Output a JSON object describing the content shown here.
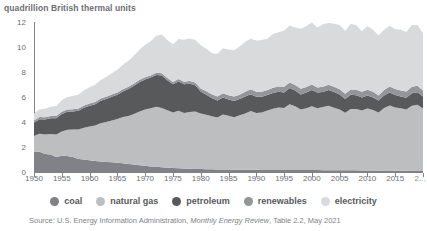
{
  "axis_title": "quadrillion British thermal units",
  "legend": {
    "items": [
      {
        "label": "coal",
        "color": "#808285"
      },
      {
        "label": "natural gas",
        "color": "#bcbec0"
      },
      {
        "label": "petroleum",
        "color": "#58595b"
      },
      {
        "label": "renewables",
        "color": "#939598"
      },
      {
        "label": "electricity",
        "color": "#d9dadb"
      }
    ]
  },
  "source": {
    "prefix": "Source: U.S. Energy Information Administration, ",
    "italic": "Monthly Energy Review",
    "suffix": ", Table 2.2, May 2021"
  },
  "chart_data": {
    "type": "area",
    "title": "",
    "subtitle": "",
    "xlabel": "",
    "ylabel": "quadrillion British thermal units",
    "xlim": [
      1950,
      2020
    ],
    "ylim": [
      0,
      12
    ],
    "yticks": [
      0,
      2,
      4,
      6,
      8,
      10,
      12
    ],
    "xticks": [
      1950,
      1955,
      1960,
      1965,
      1970,
      1975,
      1980,
      1985,
      1990,
      1995,
      2000,
      2005,
      2010,
      2015,
      2020
    ],
    "xtick_labels": [
      "1950",
      "1955",
      "1960",
      "1965",
      "1970",
      "1975",
      "1980",
      "1985",
      "1990",
      "1995",
      "2000",
      "2005",
      "2010",
      "2015",
      "2..."
    ],
    "grid": false,
    "stacked": true,
    "legend_position": "bottom",
    "annotations": [],
    "x": [
      1950,
      1951,
      1952,
      1953,
      1954,
      1955,
      1956,
      1957,
      1958,
      1959,
      1960,
      1961,
      1962,
      1963,
      1964,
      1965,
      1966,
      1967,
      1968,
      1969,
      1970,
      1971,
      1972,
      1973,
      1974,
      1975,
      1976,
      1977,
      1978,
      1979,
      1980,
      1981,
      1982,
      1983,
      1984,
      1985,
      1986,
      1987,
      1988,
      1989,
      1990,
      1991,
      1992,
      1993,
      1994,
      1995,
      1996,
      1997,
      1998,
      1999,
      2000,
      2001,
      2002,
      2003,
      2004,
      2005,
      2006,
      2007,
      2008,
      2009,
      2010,
      2011,
      2012,
      2013,
      2014,
      2015,
      2016,
      2017,
      2018,
      2019,
      2020
    ],
    "series": [
      {
        "name": "coal",
        "color": "#808285",
        "values": [
          1.6,
          1.62,
          1.45,
          1.4,
          1.2,
          1.3,
          1.28,
          1.2,
          1.05,
          1.0,
          0.95,
          0.88,
          0.85,
          0.8,
          0.78,
          0.74,
          0.7,
          0.64,
          0.6,
          0.55,
          0.5,
          0.45,
          0.42,
          0.38,
          0.34,
          0.32,
          0.3,
          0.28,
          0.26,
          0.25,
          0.24,
          0.23,
          0.22,
          0.21,
          0.21,
          0.2,
          0.19,
          0.19,
          0.19,
          0.18,
          0.18,
          0.17,
          0.17,
          0.17,
          0.17,
          0.17,
          0.17,
          0.17,
          0.16,
          0.16,
          0.16,
          0.16,
          0.15,
          0.15,
          0.15,
          0.15,
          0.14,
          0.14,
          0.14,
          0.12,
          0.13,
          0.12,
          0.11,
          0.12,
          0.12,
          0.11,
          0.1,
          0.1,
          0.1,
          0.09,
          0.08
        ]
      },
      {
        "name": "natural gas",
        "color": "#bcbec0",
        "values": [
          1.3,
          1.45,
          1.55,
          1.65,
          1.8,
          1.95,
          2.1,
          2.2,
          2.35,
          2.55,
          2.7,
          2.85,
          3.05,
          3.2,
          3.35,
          3.5,
          3.7,
          3.85,
          4.05,
          4.3,
          4.5,
          4.65,
          4.8,
          4.75,
          4.6,
          4.45,
          4.6,
          4.45,
          4.55,
          4.6,
          4.45,
          4.35,
          4.25,
          4.15,
          4.4,
          4.3,
          4.2,
          4.35,
          4.5,
          4.7,
          4.55,
          4.6,
          4.75,
          4.9,
          5.0,
          4.95,
          5.25,
          5.1,
          4.85,
          4.95,
          5.1,
          4.95,
          5.05,
          5.15,
          5.0,
          4.85,
          4.6,
          4.9,
          4.9,
          4.8,
          4.95,
          4.85,
          4.65,
          5.0,
          5.2,
          5.05,
          5.0,
          4.9,
          5.2,
          5.3,
          5.0
        ]
      },
      {
        "name": "petroleum",
        "color": "#58595b",
        "values": [
          1.05,
          1.15,
          1.2,
          1.25,
          1.3,
          1.4,
          1.45,
          1.45,
          1.5,
          1.6,
          1.65,
          1.7,
          1.8,
          1.85,
          1.9,
          1.95,
          2.05,
          2.15,
          2.25,
          2.35,
          2.4,
          2.45,
          2.55,
          2.6,
          2.4,
          2.25,
          2.35,
          2.3,
          2.25,
          2.1,
          1.75,
          1.6,
          1.45,
          1.35,
          1.35,
          1.3,
          1.3,
          1.3,
          1.35,
          1.35,
          1.3,
          1.25,
          1.25,
          1.25,
          1.25,
          1.25,
          1.3,
          1.25,
          1.2,
          1.25,
          1.3,
          1.25,
          1.2,
          1.25,
          1.25,
          1.2,
          1.1,
          1.15,
          1.1,
          1.05,
          1.05,
          1.0,
          0.95,
          1.0,
          1.05,
          1.0,
          0.95,
          0.95,
          1.0,
          1.0,
          0.95
        ]
      },
      {
        "name": "renewables",
        "color": "#939598",
        "values": [
          0.18,
          0.18,
          0.18,
          0.18,
          0.18,
          0.18,
          0.18,
          0.18,
          0.18,
          0.18,
          0.18,
          0.18,
          0.18,
          0.18,
          0.18,
          0.18,
          0.18,
          0.18,
          0.18,
          0.18,
          0.18,
          0.18,
          0.18,
          0.18,
          0.18,
          0.18,
          0.2,
          0.2,
          0.22,
          0.22,
          0.25,
          0.28,
          0.3,
          0.32,
          0.35,
          0.35,
          0.35,
          0.35,
          0.38,
          0.38,
          0.4,
          0.4,
          0.4,
          0.42,
          0.42,
          0.45,
          0.45,
          0.45,
          0.45,
          0.45,
          0.45,
          0.4,
          0.42,
          0.42,
          0.42,
          0.42,
          0.42,
          0.42,
          0.45,
          0.45,
          0.45,
          0.45,
          0.42,
          0.45,
          0.48,
          0.48,
          0.48,
          0.5,
          0.52,
          0.52,
          0.5
        ]
      },
      {
        "name": "electricity",
        "color": "#d9dadb",
        "values": [
          0.55,
          0.62,
          0.68,
          0.75,
          0.8,
          0.92,
          1.0,
          1.05,
          1.1,
          1.22,
          1.3,
          1.38,
          1.48,
          1.58,
          1.7,
          1.82,
          1.95,
          2.08,
          2.25,
          2.42,
          2.6,
          2.72,
          2.95,
          3.1,
          3.05,
          3.0,
          3.2,
          3.35,
          3.4,
          3.4,
          3.45,
          3.4,
          3.3,
          3.4,
          3.6,
          3.65,
          3.7,
          3.85,
          4.0,
          4.05,
          4.1,
          4.15,
          4.1,
          4.3,
          4.35,
          4.5,
          4.55,
          4.6,
          4.8,
          4.85,
          4.95,
          4.8,
          5.0,
          4.95,
          5.05,
          5.15,
          5.05,
          5.25,
          5.15,
          4.85,
          5.1,
          4.95,
          4.8,
          4.8,
          4.85,
          4.8,
          4.85,
          4.75,
          4.95,
          4.85,
          4.6
        ]
      }
    ]
  }
}
